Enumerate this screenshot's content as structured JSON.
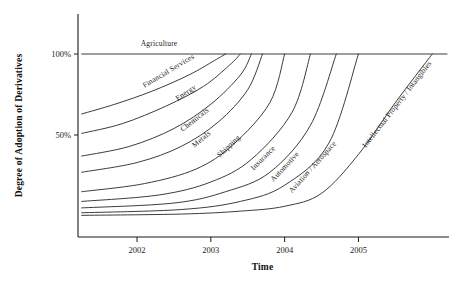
{
  "chart_data": {
    "type": "line",
    "title": "",
    "xlabel": "Time",
    "ylabel": "Degree of Adoption of Derivatives",
    "xlim": [
      2001.2,
      2006.2
    ],
    "ylim": [
      0,
      108
    ],
    "grid": false,
    "legend_position": "inline-curve-labels",
    "x_ticks": [
      "2002",
      "2003",
      "2004",
      "2005"
    ],
    "x_tick_values": [
      2002,
      2003,
      2004,
      2005
    ],
    "y_ticks": [
      "50%",
      "100%"
    ],
    "y_tick_values": [
      50,
      100
    ],
    "series": [
      {
        "name": "Agriculture",
        "label_rotation_deg": 0,
        "points": [
          [
            2001.25,
            100
          ],
          [
            2006.2,
            100
          ]
        ]
      },
      {
        "name": "Financial Services",
        "label_rotation_deg": -31,
        "points": [
          [
            2001.25,
            63
          ],
          [
            2001.7,
            69
          ],
          [
            2002.2,
            77
          ],
          [
            2002.7,
            87
          ],
          [
            2003.05,
            96
          ],
          [
            2003.2,
            100
          ]
        ]
      },
      {
        "name": "Energy",
        "label_rotation_deg": -34,
        "points": [
          [
            2001.25,
            51
          ],
          [
            2001.8,
            57
          ],
          [
            2002.4,
            68
          ],
          [
            2002.9,
            80
          ],
          [
            2003.25,
            93
          ],
          [
            2003.4,
            100
          ]
        ]
      },
      {
        "name": "Chemicals",
        "label_rotation_deg": -38,
        "points": [
          [
            2001.25,
            37
          ],
          [
            2001.9,
            43
          ],
          [
            2002.5,
            54
          ],
          [
            2003.0,
            69
          ],
          [
            2003.4,
            87
          ],
          [
            2003.55,
            100
          ]
        ]
      },
      {
        "name": "Metals",
        "label_rotation_deg": -40,
        "points": [
          [
            2001.25,
            27
          ],
          [
            2002.0,
            33
          ],
          [
            2002.6,
            43
          ],
          [
            2003.1,
            58
          ],
          [
            2003.5,
            78
          ],
          [
            2003.7,
            100
          ]
        ]
      },
      {
        "name": "Shipping",
        "label_rotation_deg": -43,
        "points": [
          [
            2001.25,
            15
          ],
          [
            2002.1,
            20
          ],
          [
            2002.8,
            29
          ],
          [
            2003.3,
            44
          ],
          [
            2003.8,
            70
          ],
          [
            2004.0,
            100
          ]
        ]
      },
      {
        "name": "Insurance",
        "label_rotation_deg": -45,
        "points": [
          [
            2001.25,
            9
          ],
          [
            2002.3,
            13
          ],
          [
            2003.0,
            21
          ],
          [
            2003.55,
            35
          ],
          [
            2004.1,
            64
          ],
          [
            2004.35,
            100
          ]
        ]
      },
      {
        "name": "Automotive",
        "label_rotation_deg": -47,
        "points": [
          [
            2001.25,
            5
          ],
          [
            2002.5,
            8
          ],
          [
            2003.2,
            15
          ],
          [
            2003.8,
            27
          ],
          [
            2004.35,
            56
          ],
          [
            2004.7,
            100
          ]
        ]
      },
      {
        "name": "Aviation / Aerospace",
        "label_rotation_deg": -48,
        "points": [
          [
            2001.25,
            2
          ],
          [
            2002.6,
            4
          ],
          [
            2003.4,
            9
          ],
          [
            2004.0,
            19
          ],
          [
            2004.6,
            45
          ],
          [
            2005.0,
            100
          ]
        ]
      },
      {
        "name": "Intellectual Property / Intangibles",
        "label_rotation_deg": -52,
        "points": [
          [
            2001.25,
            0.4
          ],
          [
            2002.6,
            1.2
          ],
          [
            2003.4,
            3
          ],
          [
            2004.0,
            6
          ],
          [
            2004.5,
            14
          ],
          [
            2005.0,
            38
          ],
          [
            2005.5,
            70
          ],
          [
            2006.0,
            100
          ]
        ]
      }
    ],
    "series_label_positions": [
      {
        "name": "Agriculture",
        "x": 2002.05,
        "y": 105
      },
      {
        "name": "Financial Services",
        "x": 2002.1,
        "y": 79
      },
      {
        "name": "Energy",
        "x": 2002.55,
        "y": 71
      },
      {
        "name": "Chemicals",
        "x": 2002.62,
        "y": 52
      },
      {
        "name": "Metals",
        "x": 2002.78,
        "y": 42
      },
      {
        "name": "Shipping",
        "x": 2003.12,
        "y": 36
      },
      {
        "name": "Insurance",
        "x": 2003.58,
        "y": 28
      },
      {
        "name": "Automotive",
        "x": 2003.85,
        "y": 21
      },
      {
        "name": "Aviation / Aerospace",
        "x": 2004.1,
        "y": 14
      },
      {
        "name": "Intellectual Property / Intangibles",
        "x": 2005.1,
        "y": 42
      }
    ]
  }
}
